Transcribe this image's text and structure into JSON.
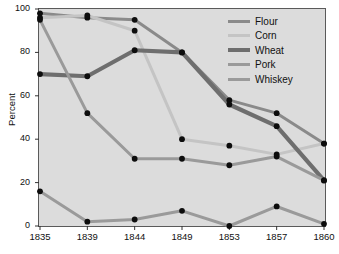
{
  "chart_data": {
    "type": "line",
    "title": "",
    "xlabel": "",
    "ylabel": "Percent",
    "x": [
      1835,
      1839,
      1844,
      1849,
      1853,
      1857,
      1860
    ],
    "xticklabels": [
      "1835",
      "1839",
      "1844",
      "1849",
      "1853",
      "1857",
      "1860"
    ],
    "yticklabels": [
      "0",
      "20",
      "40",
      "60",
      "80",
      "100"
    ],
    "yticks": [
      0,
      20,
      40,
      60,
      80,
      100
    ],
    "ylim": [
      0,
      100
    ],
    "grid": false,
    "legend_position": "top-right",
    "series": [
      {
        "name": "Flour",
        "color": "#8a8a8a",
        "width": 3.0,
        "values": [
          98,
          96,
          95,
          80,
          58,
          52,
          38
        ]
      },
      {
        "name": "Corn",
        "color": "#c4c4c4",
        "width": 3.0,
        "values": [
          96,
          97,
          90,
          40,
          37,
          33,
          38
        ]
      },
      {
        "name": "Wheat",
        "color": "#6e6e6e",
        "width": 4.2,
        "values": [
          70,
          69,
          81,
          80,
          56,
          46,
          21
        ]
      },
      {
        "name": "Pork",
        "color": "#9a9a9a",
        "width": 3.0,
        "values": [
          95,
          52,
          31,
          31,
          28,
          32,
          21
        ]
      },
      {
        "name": "Whiskey",
        "color": "#9a9a9a",
        "width": 3.0,
        "values": [
          16,
          2,
          3,
          7,
          0,
          9,
          1
        ]
      }
    ]
  },
  "axis": {
    "ylabel": "Percent",
    "yticks": [
      "100",
      "80",
      "60",
      "40",
      "20",
      "0"
    ],
    "xticks": [
      "1835",
      "1839",
      "1844",
      "1849",
      "1853",
      "1857",
      "1860"
    ]
  },
  "legend": {
    "items": [
      {
        "label": "Flour"
      },
      {
        "label": "Corn"
      },
      {
        "label": "Wheat"
      },
      {
        "label": "Pork"
      },
      {
        "label": "Whiskey"
      }
    ]
  }
}
